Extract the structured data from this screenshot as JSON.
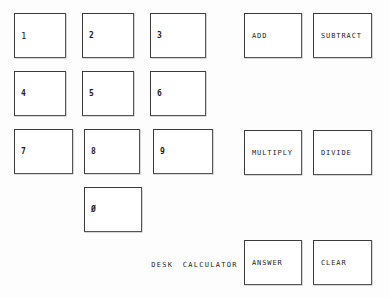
{
  "app": {
    "caption": "DESK  CALCULATOR"
  },
  "keypad": {
    "name": "numeric-keypad",
    "keys": [
      {
        "label": "1",
        "name": "key-1",
        "x": 14,
        "y": 13,
        "w": 52,
        "h": 45
      },
      {
        "label": "2",
        "name": "key-2",
        "x": 82,
        "y": 13,
        "w": 52,
        "h": 45
      },
      {
        "label": "3",
        "name": "key-3",
        "x": 150,
        "y": 13,
        "w": 56,
        "h": 45
      },
      {
        "label": "4",
        "name": "key-4",
        "x": 14,
        "y": 71,
        "w": 52,
        "h": 45
      },
      {
        "label": "5",
        "name": "key-5",
        "x": 82,
        "y": 71,
        "w": 52,
        "h": 45
      },
      {
        "label": "6",
        "name": "key-6",
        "x": 150,
        "y": 71,
        "w": 56,
        "h": 45
      },
      {
        "label": "7",
        "name": "key-7",
        "x": 14,
        "y": 129,
        "w": 59,
        "h": 45
      },
      {
        "label": "8",
        "name": "key-8",
        "x": 84,
        "y": 129,
        "w": 56,
        "h": 45
      },
      {
        "label": "9",
        "name": "key-9",
        "x": 153,
        "y": 129,
        "w": 60,
        "h": 45
      },
      {
        "label": "0",
        "name": "key-0",
        "x": 84,
        "y": 187,
        "w": 58,
        "h": 45
      }
    ]
  },
  "operations": {
    "name": "operation-buttons",
    "buttons": [
      {
        "label": "ADD",
        "name": "add-button",
        "x": 244,
        "y": 13,
        "w": 58,
        "h": 45
      },
      {
        "label": "SUBTRACT",
        "name": "subtract-button",
        "x": 313,
        "y": 13,
        "w": 59,
        "h": 45
      },
      {
        "label": "MULTIPLY",
        "name": "multiply-button",
        "x": 244,
        "y": 130,
        "w": 58,
        "h": 45
      },
      {
        "label": "DIVIDE",
        "name": "divide-button",
        "x": 313,
        "y": 130,
        "w": 59,
        "h": 45
      },
      {
        "label": "ANSWER",
        "name": "answer-button",
        "x": 244,
        "y": 240,
        "w": 58,
        "h": 45
      },
      {
        "label": "CLEAR",
        "name": "clear-button",
        "x": 313,
        "y": 240,
        "w": 59,
        "h": 45
      }
    ]
  }
}
